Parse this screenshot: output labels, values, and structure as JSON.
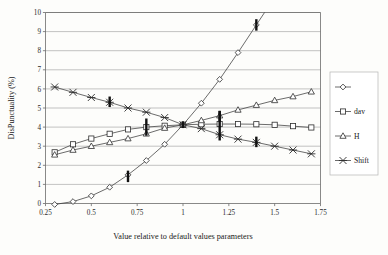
{
  "chart_data": {
    "type": "line",
    "title": "",
    "xlabel": "Value relative to default values parameters",
    "ylabel": "DisPunctuality (%)",
    "xlim": [
      0.25,
      1.75
    ],
    "ylim": [
      0,
      10
    ],
    "xticks": [
      "0.25",
      "0.5",
      "0.75",
      "1",
      "1.25",
      "1.5",
      "1.75"
    ],
    "xtick_values": [
      0.25,
      0.5,
      0.75,
      1,
      1.25,
      1.5,
      1.75
    ],
    "yticks": [
      "0",
      "1",
      "2",
      "3",
      "4",
      "5",
      "6",
      "7",
      "8",
      "9",
      "10"
    ],
    "ytick_values": [
      0,
      1,
      2,
      3,
      4,
      5,
      6,
      7,
      8,
      9,
      10
    ],
    "grid": "horizontal",
    "legend_position": "right",
    "series": [
      {
        "name": "",
        "legend_label": "",
        "marker": "diamond",
        "x": [
          0.3,
          0.4,
          0.5,
          0.6,
          0.7,
          0.8,
          0.9,
          1.0,
          1.1,
          1.2,
          1.3,
          1.4
        ],
        "values": [
          -0.05,
          0.1,
          0.4,
          0.85,
          1.5,
          2.25,
          3.1,
          4.12,
          5.25,
          6.5,
          7.9,
          9.35
        ]
      },
      {
        "name": "dav",
        "legend_label": "dav",
        "marker": "square",
        "x": [
          0.3,
          0.4,
          0.5,
          0.6,
          0.7,
          0.8,
          0.9,
          1.0,
          1.1,
          1.2,
          1.3,
          1.4,
          1.5,
          1.6,
          1.7
        ],
        "values": [
          2.68,
          3.1,
          3.4,
          3.65,
          3.88,
          4.0,
          4.07,
          4.12,
          4.15,
          4.16,
          4.16,
          4.15,
          4.12,
          4.05,
          3.98
        ]
      },
      {
        "name": "H",
        "legend_label": "H",
        "marker": "triangle",
        "x": [
          0.3,
          0.4,
          0.5,
          0.6,
          0.7,
          0.8,
          0.9,
          1.0,
          1.1,
          1.2,
          1.3,
          1.4,
          1.5,
          1.6,
          1.7
        ],
        "values": [
          2.55,
          2.8,
          3.0,
          3.2,
          3.4,
          3.65,
          3.95,
          4.12,
          4.35,
          4.6,
          4.9,
          5.15,
          5.4,
          5.6,
          5.85
        ]
      },
      {
        "name": "Shift",
        "legend_label": "Shift",
        "marker": "cross",
        "x": [
          0.3,
          0.4,
          0.5,
          0.6,
          0.7,
          0.8,
          0.9,
          1.0,
          1.1,
          1.2,
          1.3,
          1.4,
          1.5,
          1.6,
          1.7
        ],
        "values": [
          6.1,
          5.82,
          5.55,
          5.3,
          5.0,
          4.78,
          4.5,
          4.12,
          3.92,
          3.6,
          3.37,
          3.2,
          3.0,
          2.8,
          2.6
        ]
      }
    ],
    "error_bars": [
      {
        "x": 0.6,
        "low": 5.05,
        "high": 5.6
      },
      {
        "x": 0.7,
        "low": 1.12,
        "high": 1.72
      },
      {
        "x": 0.8,
        "low": 3.55,
        "high": 4.45
      },
      {
        "x": 1.0,
        "low": 3.95,
        "high": 4.3
      },
      {
        "x": 1.2,
        "low": 3.3,
        "high": 4.85
      },
      {
        "x": 1.2,
        "low": 4.3,
        "high": 4.85
      },
      {
        "x": 1.4,
        "low": 9.05,
        "high": 9.65
      },
      {
        "x": 1.4,
        "low": 2.95,
        "high": 3.5
      }
    ]
  },
  "axes": {
    "y_axis_title": "DisPunctuality (%)",
    "x_axis_title": "Value relative to default values parameters"
  },
  "legend": {
    "entries": [
      {
        "label": "",
        "marker": "diamond"
      },
      {
        "label": "dav",
        "marker": "square"
      },
      {
        "label": "H",
        "marker": "triangle"
      },
      {
        "label": "Shift",
        "marker": "cross"
      }
    ]
  }
}
